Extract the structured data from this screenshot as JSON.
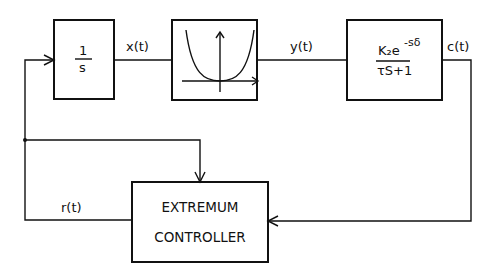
{
  "blocks": {
    "integrator": {
      "numerator": "1",
      "denominator": "s"
    },
    "nonlinearity": {
      "description": "convex parabola curve with axes"
    },
    "plant": {
      "numerator": "K₂e",
      "exponent": "-sδ",
      "denominator": "τS+1"
    },
    "controller": {
      "line1": "EXTREMUM",
      "line2": "CONTROLLER"
    }
  },
  "signals": {
    "x": "x(t)",
    "y": "y(t)",
    "c": "c(t)",
    "r": "r(t)"
  },
  "colors": {
    "line": "#111111",
    "background": "#ffffff"
  }
}
